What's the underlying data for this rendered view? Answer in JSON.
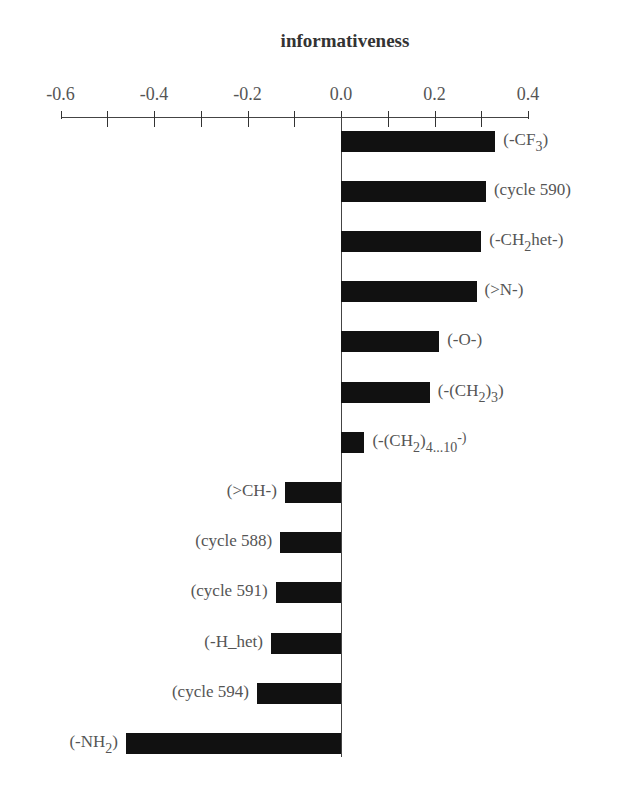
{
  "chart_data": {
    "type": "bar",
    "orientation": "horizontal",
    "title": "informativeness",
    "xlabel": "informativeness",
    "ylabel": "",
    "xlim": [
      -0.6,
      0.4
    ],
    "x_ticks": [
      "-0.6",
      "-0.4",
      "-0.2",
      "0.0",
      "0.2",
      "0.4"
    ],
    "minor_tick_step": 0.1,
    "axis_position": "top",
    "grid": false,
    "legend": null,
    "bar_color": "#111111",
    "categories": [
      "(-CF3)",
      "(cycle 590)",
      "(-CH2het-)",
      "(>N-)",
      "(-O-)",
      "(-(CH2)3)",
      "(-(CH2)4...10-)",
      "(>CH-)",
      "(cycle 588)",
      "(cycle 591)",
      "(-H_het)",
      "(cycle 594)",
      "(-NH2)"
    ],
    "values": [
      0.33,
      0.31,
      0.3,
      0.29,
      0.21,
      0.19,
      0.05,
      -0.12,
      -0.13,
      -0.14,
      -0.15,
      -0.18,
      -0.46
    ],
    "label_parts": [
      [
        [
          "t",
          "(-CF"
        ],
        [
          "sub",
          "3"
        ],
        [
          "t",
          ")"
        ]
      ],
      [
        [
          "t",
          "(cycle 590)"
        ]
      ],
      [
        [
          "t",
          "(-CH"
        ],
        [
          "sub",
          "2"
        ],
        [
          "t",
          "het-)"
        ]
      ],
      [
        [
          "t",
          "(>N-)"
        ]
      ],
      [
        [
          "t",
          "(-O-)"
        ]
      ],
      [
        [
          "t",
          "(-(CH"
        ],
        [
          "sub",
          "2"
        ],
        [
          "t",
          ")"
        ],
        [
          "sub",
          "3"
        ],
        [
          "t",
          ")"
        ]
      ],
      [
        [
          "t",
          "(-(CH"
        ],
        [
          "sub",
          "2"
        ],
        [
          "t",
          ")"
        ],
        [
          "sub",
          "4...10"
        ],
        [
          "sup",
          "-)"
        ]
      ],
      [
        [
          "t",
          "(>CH-)"
        ]
      ],
      [
        [
          "t",
          "(cycle 588)"
        ]
      ],
      [
        [
          "t",
          "(cycle 591)"
        ]
      ],
      [
        [
          "t",
          "(-H_het)"
        ]
      ],
      [
        [
          "t",
          "(cycle 594)"
        ]
      ],
      [
        [
          "t",
          "(-NH"
        ],
        [
          "sub",
          "2"
        ],
        [
          "t",
          ")"
        ]
      ]
    ]
  }
}
